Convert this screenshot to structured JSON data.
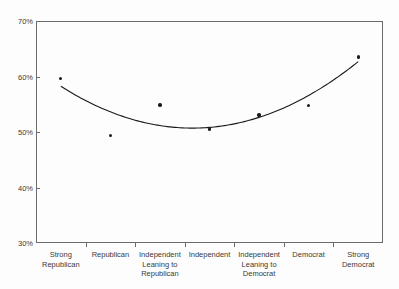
{
  "chart_data": {
    "type": "scatter",
    "title": "",
    "xlabel": "",
    "ylabel": "",
    "categories": [
      "Strong Republican",
      "Republican",
      "Independent Leaning to Republican",
      "Independent",
      "Independent Leaning to Democrat",
      "Democrat",
      "Strong Democrat"
    ],
    "category_lines": [
      [
        "Strong",
        "Republican"
      ],
      [
        "Republican"
      ],
      [
        "Independent",
        "Leaning to",
        "Republican"
      ],
      [
        "Independent"
      ],
      [
        "Independent",
        "Leaning to",
        "Democrat"
      ],
      [
        "Democrat"
      ],
      [
        "Strong",
        "Democrat"
      ]
    ],
    "values": [
      59.7,
      49.6,
      55.0,
      50.7,
      53.2,
      54.9,
      63.6
    ],
    "ylim": [
      30,
      70
    ],
    "ytick_values": [
      70,
      60,
      50,
      40,
      30
    ],
    "ytick_labels": [
      "70%",
      "60%",
      "50%",
      "40%",
      "30%"
    ],
    "grid": false,
    "legend": null,
    "trendline": {
      "type": "quadratic-fit",
      "visible": true,
      "start_value": 58.0,
      "min_value": 51.1,
      "end_value": 63.4,
      "color": "#1a1a1a"
    },
    "marker": {
      "shape": "circle",
      "color": "#1a1a1a",
      "size": 3.4
    },
    "axes": {
      "frame_color": "#6b6b6b",
      "background": "#fdfdfd"
    }
  }
}
